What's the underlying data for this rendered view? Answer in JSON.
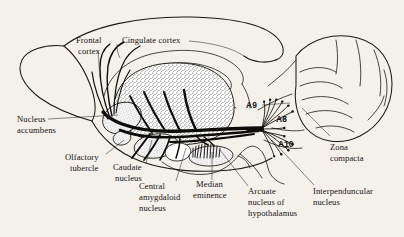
{
  "figure": {
    "background_color": "#f4f1eb",
    "ink_color": "#1b1917",
    "structures": [
      "olfactory bulb",
      "frontal cortex",
      "cingulate cortex",
      "striatum",
      "nucleus accumbens",
      "olfactory tubercle",
      "caudate nucleus",
      "central amygdaloid nucleus",
      "median eminence",
      "arcuate nucleus of hypothalamus",
      "interpenduncular nucleus",
      "substantia nigra zona compacta",
      "cerebellum",
      "brainstem"
    ]
  },
  "labels": {
    "frontal_cortex": "Frontal\ncortex",
    "frontal_cortex_line1": "Frontal",
    "frontal_cortex_line2": "cortex",
    "cingulate_cortex": "Cingulate cortex",
    "nucleus_accumbens_line1": "Nucleus",
    "nucleus_accumbens_line2": "accumbens",
    "olfactory_tubercle_line1": "Olfactory",
    "olfactory_tubercle_line2": "tubercle",
    "caudate_nucleus_line1": "Caudate",
    "caudate_nucleus_line2": "nucleus",
    "central_amygdaloid_line1": "Central",
    "central_amygdaloid_line2": "amygdaloid",
    "central_amygdaloid_line3": "nucleus",
    "median_eminence_line1": "Median",
    "median_eminence_line2": "eminence",
    "arcuate_line1": "Arcuate",
    "arcuate_line2": "nucleus of",
    "arcuate_line3": "hypothalamus",
    "interpenduncular_line1": "Interpenduncular",
    "interpenduncular_line2": "nucleus",
    "zona_compacta_line1": "Zona",
    "zona_compacta_line2": "compacta",
    "a9": "A9",
    "a8": "A8",
    "a10": "A10"
  },
  "cell_groups": [
    {
      "code": "A9",
      "name": "substantia nigra pars compacta"
    },
    {
      "code": "A8",
      "name": "retrorubral field"
    },
    {
      "code": "A10",
      "name": "ventral tegmental area"
    }
  ]
}
